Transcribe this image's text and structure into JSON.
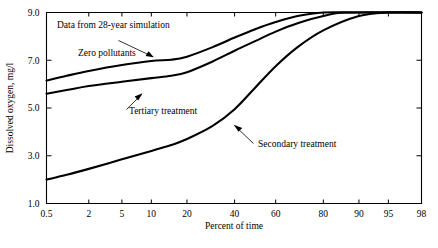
{
  "chart_data": {
    "type": "line",
    "title": "",
    "xlabel": "Percent of time",
    "ylabel": "Dissolved oxygen, mg/l",
    "x_scale": "probability",
    "xlim": [
      0.5,
      98
    ],
    "ylim": [
      1.0,
      9.0
    ],
    "grid": false,
    "legend_position": "inline-annotations",
    "xticks": [
      0.5,
      2,
      5,
      10,
      20,
      40,
      60,
      80,
      90,
      95,
      98
    ],
    "xtick_labels": [
      "0.5",
      "2",
      "5",
      "10",
      "20",
      "40",
      "60",
      "80",
      "90",
      "95",
      "98"
    ],
    "yticks": [
      1.0,
      3.0,
      5.0,
      7.0,
      9.0
    ],
    "ytick_labels": [
      "1.0",
      "3.0",
      "5.0",
      "7.0",
      "9.0"
    ],
    "annotations": [
      {
        "text": "Data from 28-year simulation",
        "x": 1.0,
        "y": 8.6
      },
      {
        "text": "Zero pollutants",
        "x": 2.0,
        "y": 7.9
      },
      {
        "text": "Tertiary treatment",
        "x": 7.0,
        "y": 5.45
      },
      {
        "text": "Secondary treatment",
        "x": 45.0,
        "y": 4.3
      }
    ],
    "series": [
      {
        "name": "Zero pollutants",
        "points": [
          [
            0.5,
            6.15
          ],
          [
            1,
            6.35
          ],
          [
            2,
            6.55
          ],
          [
            5,
            6.8
          ],
          [
            10,
            6.97
          ],
          [
            15,
            7.02
          ],
          [
            20,
            7.15
          ],
          [
            30,
            7.55
          ],
          [
            40,
            7.95
          ],
          [
            50,
            8.3
          ],
          [
            60,
            8.6
          ],
          [
            70,
            8.85
          ],
          [
            80,
            9.0
          ],
          [
            90,
            9.0
          ],
          [
            98,
            9.0
          ]
        ]
      },
      {
        "name": "Tertiary treatment",
        "points": [
          [
            0.5,
            5.6
          ],
          [
            1,
            5.75
          ],
          [
            2,
            5.92
          ],
          [
            5,
            6.1
          ],
          [
            10,
            6.25
          ],
          [
            15,
            6.35
          ],
          [
            20,
            6.5
          ],
          [
            30,
            6.95
          ],
          [
            40,
            7.4
          ],
          [
            50,
            7.8
          ],
          [
            60,
            8.2
          ],
          [
            70,
            8.55
          ],
          [
            80,
            8.85
          ],
          [
            87,
            9.0
          ],
          [
            98,
            9.0
          ]
        ]
      },
      {
        "name": "Secondary treatment",
        "points": [
          [
            0.5,
            2.0
          ],
          [
            1,
            2.2
          ],
          [
            2,
            2.45
          ],
          [
            5,
            2.85
          ],
          [
            10,
            3.2
          ],
          [
            15,
            3.45
          ],
          [
            20,
            3.7
          ],
          [
            30,
            4.25
          ],
          [
            40,
            4.95
          ],
          [
            50,
            5.85
          ],
          [
            60,
            6.75
          ],
          [
            70,
            7.55
          ],
          [
            80,
            8.25
          ],
          [
            90,
            8.85
          ],
          [
            95,
            9.0
          ],
          [
            98,
            9.0
          ]
        ]
      }
    ]
  },
  "labels": {
    "y_axis_title": "Dissolved oxygen, mg/l",
    "x_axis_title": "Percent of time",
    "note": "Data from 28-year simulation",
    "curve_zero": "Zero pollutants",
    "curve_tertiary": "Tertiary treatment",
    "curve_secondary": "Secondary treatment"
  },
  "colors": {
    "background": "#ffffff",
    "ink": "#000000"
  }
}
